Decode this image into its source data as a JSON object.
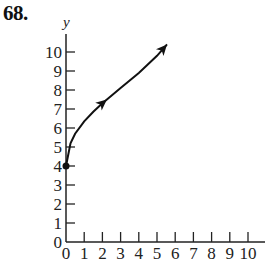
{
  "problem": {
    "number": "68."
  },
  "chart_data": {
    "type": "line",
    "title": "",
    "xlabel": "",
    "ylabel": "y",
    "xlim": [
      0,
      10
    ],
    "ylim": [
      0,
      10
    ],
    "x_ticks": [
      "0",
      "1",
      "2",
      "3",
      "4",
      "5",
      "6",
      "7",
      "8",
      "9",
      "10"
    ],
    "y_ticks": [
      "0",
      "1",
      "2",
      "3",
      "4",
      "5",
      "6",
      "7",
      "8",
      "9",
      "10"
    ],
    "grid": false,
    "series": [
      {
        "name": "curve",
        "start_point": {
          "x": 0,
          "y": 4,
          "closed_dot": true
        },
        "x": [
          0,
          0.25,
          0.5,
          1,
          1.5,
          2,
          2.25,
          3,
          4,
          5,
          5.55
        ],
        "y": [
          4,
          5.2,
          5.7,
          6.35,
          6.85,
          7.3,
          7.5,
          8.1,
          8.9,
          9.8,
          10.4
        ],
        "arrows_at": [
          2.25,
          5.55
        ]
      }
    ],
    "caption_partial": "…1/2…"
  }
}
